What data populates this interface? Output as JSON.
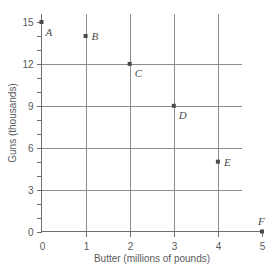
{
  "chart_data": {
    "type": "scatter",
    "title": "",
    "xlabel": "Butter (millions of pounds)",
    "ylabel": "Guns (thousands)",
    "xlim": [
      0,
      5
    ],
    "ylim": [
      0,
      15
    ],
    "grid": true,
    "legend": "none",
    "x_ticks": [
      "0",
      "1",
      "2",
      "3",
      "4",
      "5"
    ],
    "x_tick_values": [
      0,
      1,
      2,
      3,
      4,
      5
    ],
    "y_ticks": [
      "0",
      "3",
      "6",
      "9",
      "12",
      "15"
    ],
    "y_tick_values": [
      0,
      3,
      6,
      9,
      12,
      15
    ],
    "y_minor_tick_values": [
      1,
      2,
      4,
      5,
      7,
      8,
      10,
      11,
      13,
      14
    ],
    "x_gridlines": [
      1,
      2,
      3,
      4
    ],
    "y_gridlines": [
      3,
      6,
      9,
      12
    ],
    "point_color": "#4a4a4a",
    "grid_color": "#8c8c8c",
    "axis_color": "#6e6e6e",
    "points": [
      {
        "label": "A",
        "x": 0,
        "y": 15,
        "label_dx": 4,
        "label_dy": 14
      },
      {
        "label": "B",
        "x": 1,
        "y": 14,
        "label_dx": 6,
        "label_dy": 4
      },
      {
        "label": "C",
        "x": 2,
        "y": 12,
        "label_dx": 5,
        "label_dy": 13
      },
      {
        "label": "D",
        "x": 3,
        "y": 9,
        "label_dx": 5,
        "label_dy": 13
      },
      {
        "label": "E",
        "x": 4,
        "y": 5,
        "label_dx": 6,
        "label_dy": 4
      },
      {
        "label": "F",
        "x": 5,
        "y": 0,
        "label_dx": -4,
        "label_dy": -7
      }
    ]
  }
}
